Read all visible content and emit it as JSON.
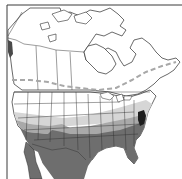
{
  "map": {
    "type": "range_map",
    "region": "North America",
    "colors": {
      "background": "#ffffff",
      "frame": "#3a3a3a",
      "border_lines": "#2a2a2a",
      "range_limit_dashed": "#a8a8a8",
      "zone_unshaded": "#ffffff",
      "zone_light": "#d6d6d6",
      "zone_medium": "#a9a9a9",
      "zone_dark": "#6e6e6e",
      "zone_darkest": "#1e1e1e"
    },
    "legend": [],
    "features": [
      {
        "name": "northern-range-limit",
        "style": "dashed line across southern Canada"
      },
      {
        "name": "light-zone",
        "description": "light gray band across northern US"
      },
      {
        "name": "medium-zone",
        "description": "mid gray band across central US"
      },
      {
        "name": "dark-zone",
        "description": "dark gray southern US and Mexico"
      },
      {
        "name": "darkest-zone",
        "description": "near-black patch on mid-Atlantic coast"
      }
    ]
  }
}
